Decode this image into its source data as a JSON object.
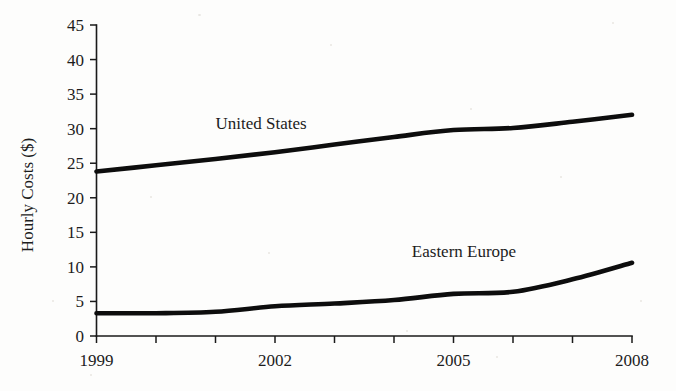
{
  "chart_data": {
    "type": "line",
    "title": "",
    "xlabel": "",
    "ylabel": "Hourly Costs ($)",
    "xlim": [
      1999,
      2008
    ],
    "ylim": [
      0,
      45
    ],
    "grid": false,
    "legend_position": "inline-labels",
    "x": [
      1999,
      2000,
      2001,
      2002,
      2003,
      2004,
      2005,
      2006,
      2007,
      2008
    ],
    "y_ticks": [
      0,
      5,
      10,
      15,
      20,
      25,
      30,
      35,
      40,
      45
    ],
    "y_tick_labels": [
      "0",
      "5",
      "10",
      "15",
      "20",
      "25",
      "30",
      "35",
      "40",
      "45"
    ],
    "x_ticks": [
      1999,
      2000,
      2001,
      2002,
      2003,
      2004,
      2005,
      2006,
      2007,
      2008
    ],
    "x_tick_labels": [
      "1999",
      "",
      "",
      "2002",
      "",
      "",
      "2005",
      "",
      "",
      "2008"
    ],
    "x_labeled_ticks": [
      "1999",
      "2002",
      "2005",
      "2008"
    ],
    "series": [
      {
        "name": "United States",
        "label": "United States",
        "color": "#0d0d0d",
        "values": [
          23.8,
          24.7,
          25.6,
          26.6,
          27.7,
          28.8,
          29.8,
          30.1,
          31.0,
          32.0
        ]
      },
      {
        "name": "Eastern Europe",
        "label": "Eastern Europe",
        "color": "#0d0d0d",
        "values": [
          3.3,
          3.3,
          3.5,
          4.3,
          4.7,
          5.2,
          6.1,
          6.4,
          8.2,
          10.6
        ]
      }
    ],
    "annotations": [
      {
        "text": "United States",
        "x": 2001.0,
        "y": 30.0
      },
      {
        "text": "Eastern Europe",
        "x": 2004.3,
        "y": 11.5
      }
    ]
  },
  "colors": {
    "line": "#0d0d0d",
    "axis": "#1a1a1a",
    "text": "#1c1c1c",
    "background": "#fdfdfc"
  }
}
